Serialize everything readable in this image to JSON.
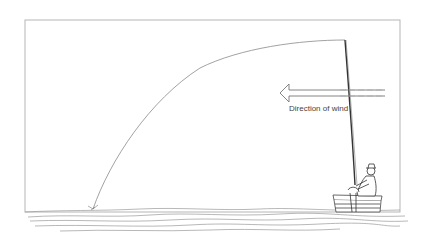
{
  "figure": {
    "type": "illustration",
    "annotation": {
      "wind_label": "Direction of wind"
    },
    "elements": {
      "frame": "rectangular border",
      "rod": "long fishing rod held by seated angler",
      "line": "curved fishing line from rod tip arcing to water on the left",
      "arrow": "hollow left-pointing arrow indicating wind direction",
      "water": "wavy water surface lines",
      "platform": "wooden box/platform angler sits on"
    },
    "colors": {
      "line": "#8a8a8a",
      "rod": "#333333",
      "frame": "#b5b5b5",
      "text": "#444444",
      "water": "#9a9a9a",
      "background": "#ffffff"
    }
  }
}
